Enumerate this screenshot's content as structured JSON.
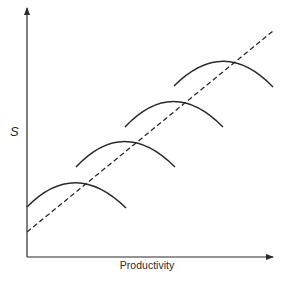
{
  "diagram": {
    "y_axis_label": "S",
    "x_axis_label": "Productivity",
    "colors": {
      "line": "#2a2a2a",
      "background": "#ffffff"
    },
    "elements": {
      "trend_line": {
        "style": "dashed",
        "from": [
          27,
          232
        ],
        "to": [
          273,
          31
        ]
      },
      "curves": [
        {
          "name": "curve-1",
          "start": [
            27,
            207
          ],
          "peak": [
            73,
            182
          ],
          "end": [
            126,
            208
          ]
        },
        {
          "name": "curve-2",
          "start": [
            76,
            167
          ],
          "peak": [
            123,
            141
          ],
          "end": [
            175,
            167
          ]
        },
        {
          "name": "curve-3",
          "start": [
            125,
            127
          ],
          "peak": [
            172,
            101
          ],
          "end": [
            223,
            127
          ]
        },
        {
          "name": "curve-4",
          "start": [
            174,
            86
          ],
          "peak": [
            224,
            61
          ],
          "end": [
            273,
            87
          ]
        }
      ]
    }
  }
}
